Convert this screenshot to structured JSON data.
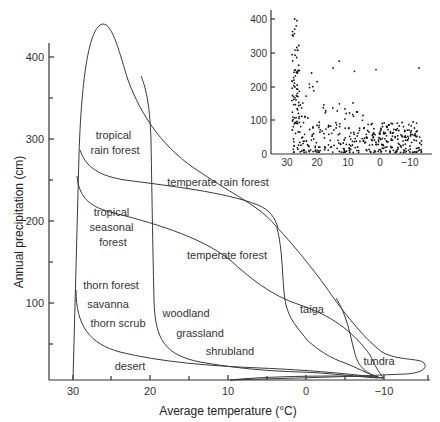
{
  "figure": {
    "main": {
      "xlabel": "Average temperature (°C)",
      "ylabel": "Annual precipitation (cm)",
      "x_ticks": [
        "30",
        "20",
        "10",
        "0",
        "−10"
      ],
      "y_ticks": [
        "400",
        "300",
        "200",
        "100"
      ]
    },
    "biomes": [
      {
        "id": "tropical-rain-forest",
        "lines": [
          "tropical",
          "rain forest"
        ]
      },
      {
        "id": "temperate-rain-forest",
        "lines": [
          "temperate rain forest"
        ]
      },
      {
        "id": "tropical-seasonal-forest",
        "lines": [
          "tropical",
          "seasonal",
          "forest"
        ]
      },
      {
        "id": "temperate-forest",
        "lines": [
          "temperate forest"
        ]
      },
      {
        "id": "thorn-forest",
        "lines": [
          "thorn forest"
        ]
      },
      {
        "id": "savanna",
        "lines": [
          "savanna"
        ]
      },
      {
        "id": "thorn-scrub",
        "lines": [
          "thorn scrub"
        ]
      },
      {
        "id": "woodland",
        "lines": [
          "woodland"
        ]
      },
      {
        "id": "grassland",
        "lines": [
          "grassland"
        ]
      },
      {
        "id": "shrubland",
        "lines": [
          "shrubland"
        ]
      },
      {
        "id": "taiga",
        "lines": [
          "taiga"
        ]
      },
      {
        "id": "tundra",
        "lines": [
          "tundra"
        ]
      },
      {
        "id": "desert",
        "lines": [
          "desert"
        ]
      }
    ],
    "inset": {
      "x_ticks": [
        "30",
        "20",
        "10",
        "0",
        "−10"
      ],
      "y_ticks": [
        "400",
        "300",
        "200",
        "100",
        "0"
      ]
    }
  },
  "chart_data": [
    {
      "type": "diagram",
      "title": "Whittaker biome diagram",
      "xlabel": "Average temperature (°C)",
      "ylabel": "Annual precipitation (cm)",
      "xlim": [
        32,
        -15
      ],
      "ylim": [
        0,
        450
      ],
      "x_ticks": [
        30,
        20,
        10,
        0,
        -10
      ],
      "y_ticks": [
        100,
        200,
        300,
        400
      ],
      "regions": [
        "tropical rain forest",
        "temperate rain forest",
        "tropical seasonal forest",
        "temperate forest",
        "thorn forest",
        "savanna",
        "thorn scrub",
        "woodland",
        "grassland",
        "shrubland",
        "taiga",
        "tundra",
        "desert"
      ]
    },
    {
      "type": "scatter",
      "title": "inset: climate station data",
      "xlabel": "",
      "ylabel": "",
      "xlim": [
        32,
        -15
      ],
      "ylim": [
        0,
        420
      ],
      "x_ticks": [
        30,
        20,
        10,
        0,
        -10
      ],
      "y_ticks": [
        0,
        100,
        200,
        300,
        400
      ],
      "note": "Dense cloud of several hundred points; highest precipitation (up to ~400 cm) near 26-27°C, declining toward colder temperatures; outliers ~250 cm at 0°C and -13°C"
    }
  ]
}
